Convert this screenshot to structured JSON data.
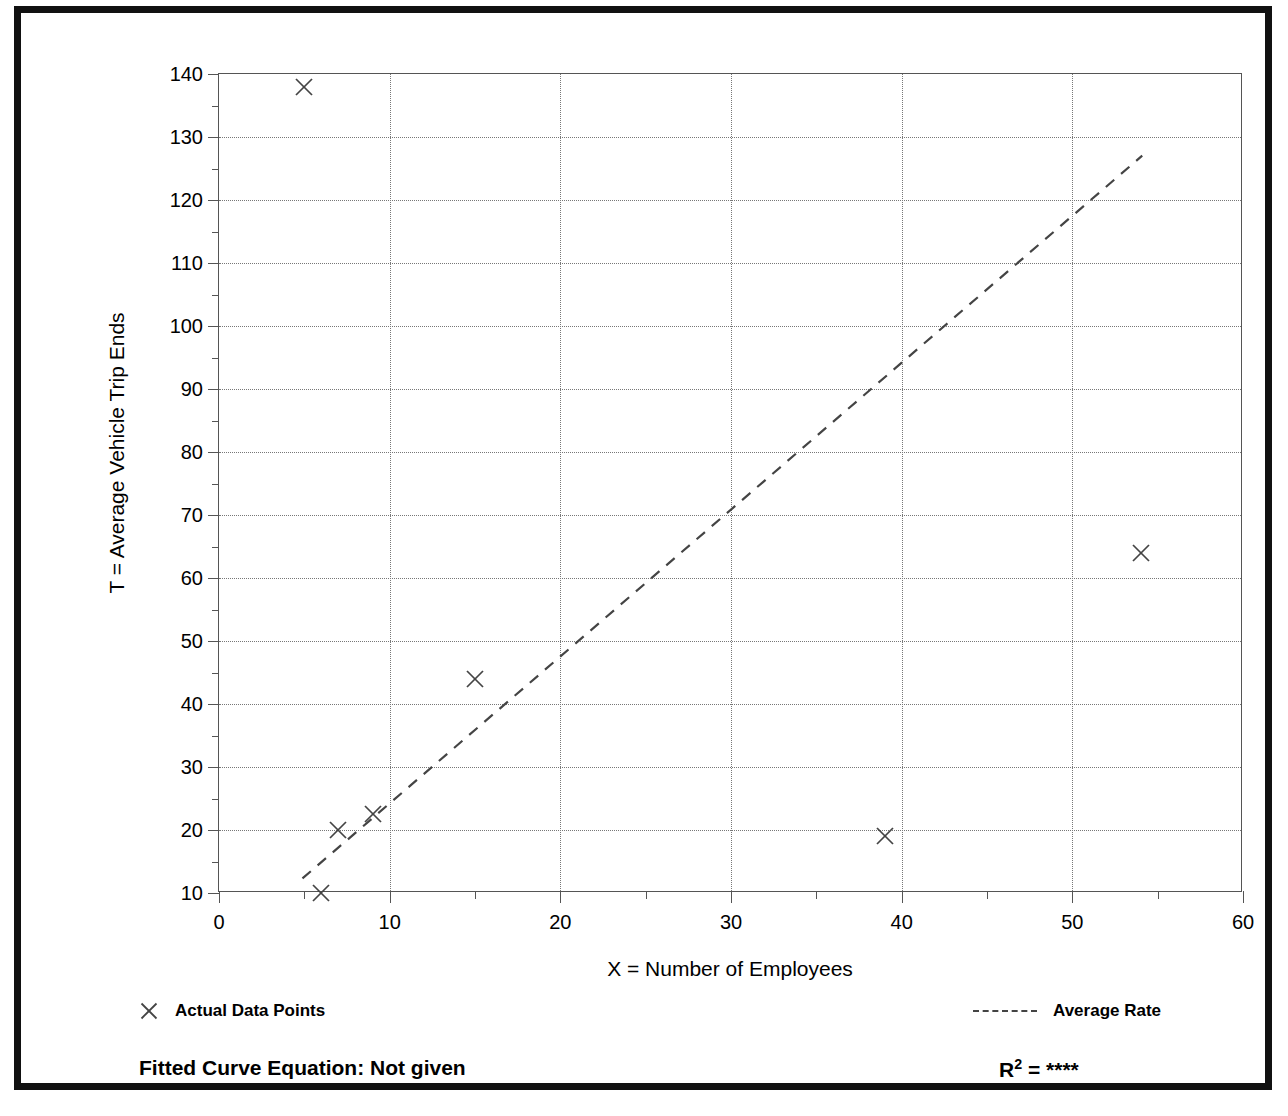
{
  "chart_data": {
    "type": "scatter",
    "title": "",
    "xlabel": "X = Number of Employees",
    "ylabel": "T = Average Vehicle Trip Ends",
    "xlim": [
      0,
      60
    ],
    "ylim": [
      10,
      140
    ],
    "x_ticks": [
      0,
      10,
      20,
      30,
      40,
      50,
      60
    ],
    "x_tick_labels": [
      "0",
      "10",
      "20",
      "30",
      "40",
      "50",
      "60"
    ],
    "x_minor_tick_step": 5,
    "y_ticks": [
      10,
      20,
      30,
      40,
      50,
      60,
      70,
      80,
      90,
      100,
      110,
      120,
      130,
      140
    ],
    "y_tick_labels": [
      "10",
      "20",
      "30",
      "40",
      "50",
      "60",
      "70",
      "80",
      "90",
      "100",
      "110",
      "120",
      "130",
      "140"
    ],
    "y_minor_tick_step": 5,
    "grid": true,
    "grid_style": "dotted",
    "legend_position": "below-plot",
    "series": [
      {
        "name": "Actual Data Points",
        "type": "scatter",
        "marker": "x",
        "points": [
          {
            "x": 5,
            "y": 138
          },
          {
            "x": 15,
            "y": 44
          },
          {
            "x": 7,
            "y": 20
          },
          {
            "x": 9,
            "y": 22.5
          },
          {
            "x": 6,
            "y": 10
          },
          {
            "x": 39,
            "y": 19
          },
          {
            "x": 54,
            "y": 64
          }
        ]
      },
      {
        "name": "Average Rate",
        "type": "line",
        "style": "dashed",
        "endpoints": [
          {
            "x": 4.9,
            "y": 12
          },
          {
            "x": 54.2,
            "y": 127
          }
        ]
      }
    ]
  },
  "axes": {
    "y_title": "T = Average Vehicle Trip Ends",
    "x_title": "X = Number of Employees"
  },
  "legend": {
    "data_points_label": "Actual Data Points",
    "average_rate_label": "Average Rate"
  },
  "footer": {
    "equation_label": "Fitted Curve Equation:  Not given",
    "r2_prefix": "R",
    "r2_exponent": "2",
    "r2_value": "= ****"
  },
  "colors": {
    "frame": "#111111",
    "axis": "#555555",
    "grid": "#777777",
    "marker": "#444444",
    "trendline": "#444444",
    "background": "#ffffff"
  }
}
